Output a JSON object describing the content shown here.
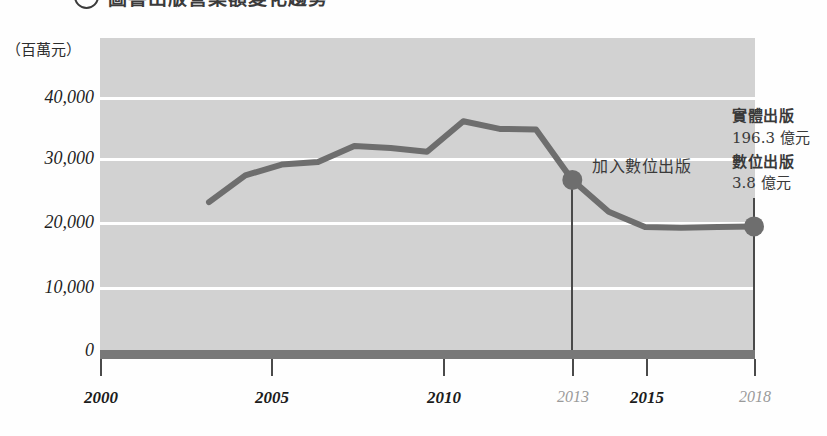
{
  "title": {
    "text": "圖書出版營業額變化趨勢",
    "bullet_icon": "circle-number-bullet"
  },
  "unit_label": "（百萬元）",
  "annotations": {
    "join_digital": "加入數位出版",
    "legend": {
      "physical_label": "實體出版",
      "physical_value": "196.3 億元",
      "digital_label": "數位出版",
      "digital_value": "3.8 億元"
    }
  },
  "colors": {
    "plot_background": "#d2d2d2",
    "gridline": "#ffffff",
    "series_line": "#6e6e6e",
    "marker": "#6e6e6e",
    "baseline_bar": "#787878",
    "axis": "#4a4a4a",
    "text": "#1f1f1f",
    "muted_text": "#9a9a9a"
  },
  "chart_data": {
    "type": "line",
    "title": "圖書出版營業額變化趨勢",
    "xlabel": "",
    "ylabel": "百萬元",
    "ylim": [
      0,
      45000
    ],
    "xlim": [
      2000,
      2019
    ],
    "grid": true,
    "legend_position": "right",
    "y_ticks": [
      "0",
      "10,000",
      "20,000",
      "30,000",
      "40,000"
    ],
    "y_tick_values": [
      0,
      10000,
      20000,
      30000,
      40000
    ],
    "x_ticks": [
      "2000",
      "2005",
      "2010",
      "2013",
      "2015",
      "2018"
    ],
    "x_tick_values": [
      2000,
      2005,
      2010,
      2013,
      2015,
      2018
    ],
    "x_tick_muted": [
      false,
      false,
      false,
      true,
      false,
      true
    ],
    "series": [
      {
        "name": "圖書出版營業額",
        "x": [
          2003,
          2004,
          2005,
          2006,
          2007,
          2008,
          2009,
          2010,
          2011,
          2012,
          2013,
          2014,
          2015,
          2016,
          2017,
          2018
        ],
        "values": [
          23500,
          27700,
          29400,
          29800,
          32300,
          32000,
          31400,
          36200,
          35000,
          34900,
          27000,
          22000,
          19600,
          19500,
          19600,
          19700
        ]
      }
    ],
    "markers": [
      {
        "x": 2013,
        "y": 27000,
        "label": "加入數位出版"
      },
      {
        "x": 2018,
        "y": 19700,
        "label": "2018"
      }
    ]
  }
}
